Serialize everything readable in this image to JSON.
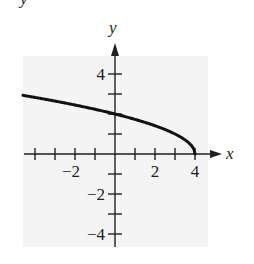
{
  "chart_data": {
    "type": "line",
    "title": "",
    "xlabel": "x",
    "ylabel": "y",
    "xlim": [
      -4.5,
      5.3
    ],
    "ylim": [
      -4.7,
      5.5
    ],
    "x_ticks": [
      -4,
      -3,
      -2,
      -1,
      1,
      2,
      3,
      4
    ],
    "y_ticks": [
      -4,
      -3,
      -2,
      -1,
      1,
      2,
      3,
      4
    ],
    "x_tick_labels": [
      {
        "value": -2,
        "label": "−2"
      },
      {
        "value": 2,
        "label": "2"
      },
      {
        "value": 4,
        "label": "4"
      }
    ],
    "y_tick_labels": [
      {
        "value": 4,
        "label": "4"
      },
      {
        "value": -2,
        "label": "−2"
      },
      {
        "value": -4,
        "label": "−4"
      }
    ],
    "grid": false,
    "series": [
      {
        "name": "curve",
        "description": "y = sqrt(4 - x), ending at (4, 0)",
        "x": [
          -4.6,
          -4,
          -3,
          -2,
          -1,
          0,
          1,
          2,
          3,
          3.5,
          3.9,
          4
        ],
        "y": [
          2.93,
          2.83,
          2.65,
          2.45,
          2.24,
          2.0,
          1.73,
          1.41,
          1.0,
          0.71,
          0.32,
          0
        ]
      }
    ],
    "background_color": "#f4f4f4",
    "curve_color": "#111111"
  },
  "labels": {
    "x_axis": "x",
    "y_axis": "y",
    "top_cut_text": "y"
  }
}
